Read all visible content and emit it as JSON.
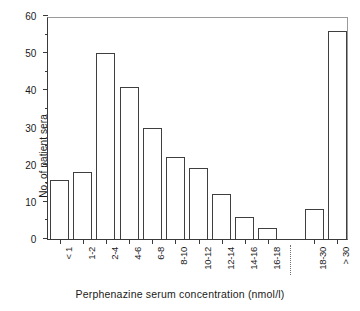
{
  "chart_data": {
    "type": "bar",
    "title": "",
    "subtitle": "",
    "xlabel": "Perphenazine serum concentration (nmol/l)",
    "ylabel": "No. of patient sera",
    "categories": [
      "< 1",
      "1-2",
      "2-4",
      "4-6",
      "6-8",
      "8-10",
      "10-12",
      "12-14",
      "14-16",
      "16-18",
      "18-30",
      "> 30"
    ],
    "values": [
      16,
      18,
      50,
      41,
      30,
      22,
      19,
      12,
      6,
      3,
      8,
      56
    ],
    "series": [
      {
        "name": "No. of patient sera",
        "values": [
          16,
          18,
          50,
          41,
          30,
          22,
          19,
          12,
          6,
          3,
          8,
          56
        ]
      }
    ],
    "ylim": [
      0,
      60
    ],
    "ytick_labels": [
      "0",
      "10",
      "20",
      "30",
      "40",
      "50",
      "60"
    ],
    "ytick_values": [
      0,
      10,
      20,
      30,
      40,
      50,
      60
    ],
    "yminor_tick_values": [
      5,
      15,
      25,
      35,
      45,
      55
    ],
    "grid": false,
    "legend": false,
    "legend_position": "none",
    "annotations": [
      {
        "name": "axis-break",
        "description": "dotted vertical break between 16-18 and 18-30 categories",
        "after_category": "16-18"
      }
    ],
    "colors": {
      "bar_fill": "#ffffff",
      "bar_edge": "#3f3f3f",
      "axis": "#3a3a3a",
      "frame": "#9a9a9a",
      "text": "#1a1a1a",
      "background": "#ffffff"
    }
  }
}
